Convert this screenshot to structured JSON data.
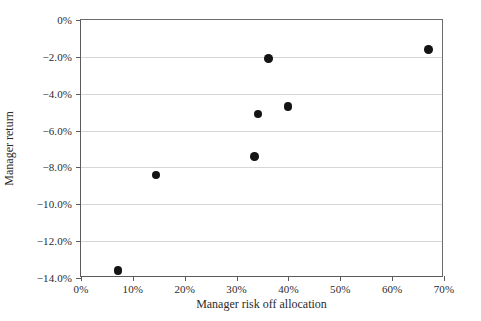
{
  "chart_data": {
    "type": "scatter",
    "title": "",
    "xlabel": "Manager risk off allocation",
    "ylabel": "Manager return",
    "xlim": [
      0,
      70
    ],
    "ylim": [
      -14,
      0
    ],
    "xticks": [
      0,
      10,
      20,
      30,
      40,
      50,
      60,
      70
    ],
    "xtick_labels": [
      "0%",
      "10%",
      "20%",
      "30%",
      "40%",
      "50%",
      "60%",
      "70%"
    ],
    "yticks": [
      0,
      -2,
      -4,
      -6,
      -8,
      -10,
      -12,
      -14
    ],
    "ytick_labels": [
      "0%",
      "−2.0%",
      "−4.0%",
      "−6.0%",
      "−8.0%",
      "−10.0%",
      "−12.0%",
      "−14.0%"
    ],
    "grid": "horizontal",
    "legend": null,
    "marker": {
      "shape": "circle",
      "color": "#141414",
      "size_px": 8.5
    },
    "points": [
      {
        "x": 7.1,
        "y": -13.6
      },
      {
        "x": 14.5,
        "y": -8.4
      },
      {
        "x": 33.5,
        "y": -7.4
      },
      {
        "x": 34.1,
        "y": -5.1
      },
      {
        "x": 39.9,
        "y": -4.7
      },
      {
        "x": 36.2,
        "y": -2.1
      },
      {
        "x": 67.0,
        "y": -1.6
      }
    ]
  },
  "colors": {
    "axis": "#5a5a5a",
    "gridline": "#d6d6d6",
    "marker": "#141414",
    "text": "#2b2b2b",
    "background": "#ffffff"
  }
}
